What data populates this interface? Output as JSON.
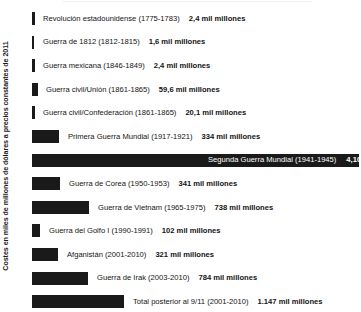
{
  "chart": {
    "axis_caption": "Costes en miles de millones de dólares a precios constantes de 2011"
  },
  "chart_data": {
    "type": "bar",
    "title": "",
    "xlabel": "",
    "ylabel": "Costes en miles de millones de dólares a precios constantes de 2011",
    "orientation": "horizontal",
    "grid": false,
    "legend": false,
    "units": "miles de millones de dólares (precios constantes de 2011)",
    "xlim": [
      0,
      4104
    ],
    "categories": [
      "Revolución estadounidense (1775-1783)",
      "Guerra de 1812 (1812-1815)",
      "Guerra mexicana (1846-1849)",
      "Guerra civil/Unión (1861-1865)",
      "Guerra civil/Confederación (1861-1865)",
      "Primera Guerra Mundial (1917-1921)",
      "Segunda Guerra Mundial (1941-1945)",
      "Guerra de Corea (1950-1953)",
      "Guerra de Vietnam (1965-1975)",
      "Guerra del Golfo I (1990-1991)",
      "Afganistán (2001-2010)",
      "Guerra de Irak (2003-2010)",
      "Total posterior al 9/11 (2001-2010)"
    ],
    "values": [
      2.4,
      1.6,
      2.4,
      59.6,
      20.1,
      334,
      4104,
      341,
      738,
      102,
      321,
      784,
      1147
    ],
    "value_labels": [
      "2,4 mil millones",
      "1,6 mil millones",
      "2,4 mil millones",
      "59,6 mil millones",
      "20,1 mil millones",
      "334 mil millones",
      "4,104 billion",
      "341 mil millones",
      "738 mil millones",
      "102 mil millones",
      "321 mil millones",
      "784 mil millones",
      "1.147 mil millones"
    ]
  },
  "rows": [
    {
      "name": "Revolución estadounidense (1775-1783)",
      "value": "2,4 mil millones",
      "bar_w": 3,
      "label_x": 11,
      "inside": false
    },
    {
      "name": "Guerra de 1812 (1812-1815)",
      "value": "1,6 mil millones",
      "bar_w": 2,
      "label_x": 11,
      "inside": false
    },
    {
      "name": "Guerra mexicana (1846-1849)",
      "value": "2,4 mil millones",
      "bar_w": 3,
      "label_x": 11,
      "inside": false
    },
    {
      "name": "Guerra civil/Unión (1861-1865)",
      "value": "59,6 mil millones",
      "bar_w": 6,
      "label_x": 14,
      "inside": false
    },
    {
      "name": "Guerra civil/Confederación (1861-1865)",
      "value": "20,1 mil millones",
      "bar_w": 3,
      "label_x": 11,
      "inside": false
    },
    {
      "name": "Primera Guerra Mundial (1917-1921)",
      "value": "334 mil millones",
      "bar_w": 27,
      "label_x": 36,
      "inside": false
    },
    {
      "name": "Segunda Guerra Mundial (1941-1945)",
      "value": "4,104 billion",
      "bar_w": 327,
      "label_x": 176,
      "inside": true
    },
    {
      "name": "Guerra de Corea (1950-1953)",
      "value": "341 mil millones",
      "bar_w": 28,
      "label_x": 37,
      "inside": false
    },
    {
      "name": "Guerra de Vietnam (1965-1975)",
      "value": "738 mil millones",
      "bar_w": 57,
      "label_x": 66,
      "inside": false
    },
    {
      "name": "Guerra del Golfo I (1990-1991)",
      "value": "102 mil millones",
      "bar_w": 8,
      "label_x": 17,
      "inside": false
    },
    {
      "name": "Afganistán (2001-2010)",
      "value": "321 mil millones",
      "bar_w": 26,
      "label_x": 35,
      "inside": false
    },
    {
      "name": "Guerra de Irak (2003-2010)",
      "value": "784 mil millones",
      "bar_w": 56,
      "label_x": 65,
      "inside": false
    },
    {
      "name": "Total posterior al 9/11 (2001-2010)",
      "value": "1.147 mil millones",
      "bar_w": 92,
      "label_x": 101,
      "inside": false
    }
  ]
}
